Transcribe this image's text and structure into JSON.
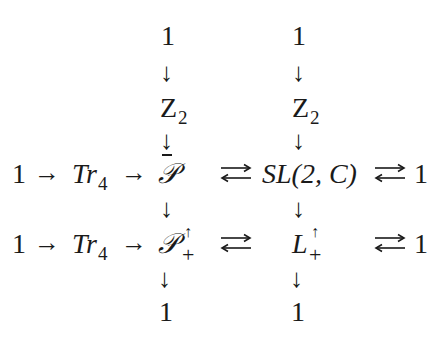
{
  "diagram": {
    "type": "commutative-diagram",
    "left_column": {
      "top_one": "1",
      "z2": "Z",
      "z2_sub": "2",
      "middle": "𝒫",
      "middle_bar": true,
      "bottom": "𝒫",
      "bottom_sup": "↑",
      "bottom_sub": "+",
      "end_one": "1"
    },
    "right_column": {
      "top_one": "1",
      "z2": "Z",
      "z2_sub": "2",
      "middle": "SL(2, C)",
      "bottom": "L",
      "bottom_sup": "↑",
      "bottom_sub": "+",
      "end_one": "1"
    },
    "row_middle": {
      "start_one": "1",
      "tr": "Tr",
      "tr_sub": "4",
      "end_one": "1"
    },
    "row_bottom": {
      "start_one": "1",
      "tr": "Tr",
      "tr_sub": "4",
      "end_one": "1"
    },
    "arrows": {
      "right": "→",
      "down": "↓"
    }
  }
}
